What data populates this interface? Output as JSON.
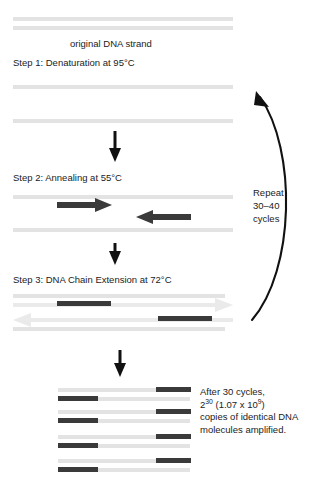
{
  "diagram": {
    "original_label": "original DNA strand",
    "step1_label": "Step 1: Denaturation at 95°C",
    "step2_label": "Step 2: Annealing at 55°C",
    "step3_label": "Step 3: DNA Chain Extension at 72°C",
    "repeat_line1": "Repeat",
    "repeat_line2": "30–40",
    "repeat_line3": "cycles",
    "result_line1": "After 30 cycles,",
    "result_line2_base": "2",
    "result_line2_exp": "30",
    "result_line2_mid": " (1.07 x 10",
    "result_line2_exp2": "9",
    "result_line2_end": ")",
    "result_line3": "copies of identical DNA",
    "result_line4": "molecules  amplified.",
    "colors": {
      "strand_gray": "#e3e3e3",
      "primer_dark": "#3a3a3a",
      "arrow_black": "#111111",
      "text": "#1b1b1b",
      "background": "#ffffff"
    }
  }
}
